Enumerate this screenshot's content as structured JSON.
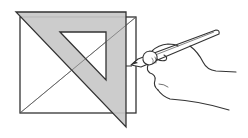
{
  "illustration": {
    "subject": "Hand drawing a line with a pencil along a set square placed over a square with diagonals",
    "elements": {
      "square": "square-outline",
      "diagonals": "two-diagonals",
      "set_square": "triangular-set-square",
      "pencil": "pencil",
      "hand": "hand"
    },
    "colors": {
      "background": "#ffffff",
      "stroke": "#333333",
      "set_square_fill": "#c8c8c8",
      "diagonal_stroke": "#555555"
    }
  }
}
